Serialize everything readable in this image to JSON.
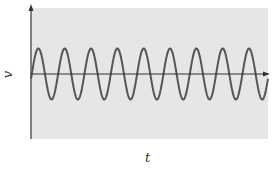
{
  "chart_data": {
    "type": "line",
    "title": "",
    "xlabel": "t",
    "ylabel": "v",
    "grid": false,
    "legend": null,
    "background_color": "#e6e6e6",
    "curve_color": "#555555",
    "axis_color": "#333333",
    "series": [
      {
        "name": "v(t)",
        "function": "sine",
        "amplitude": 1,
        "cycles": 9,
        "phase": 0
      }
    ],
    "xlim": [
      0,
      9
    ],
    "ylim": [
      -2.6,
      2.6
    ],
    "x_ticks": [],
    "y_ticks": []
  },
  "labels": {
    "x_axis": "t",
    "y_axis": "v"
  }
}
